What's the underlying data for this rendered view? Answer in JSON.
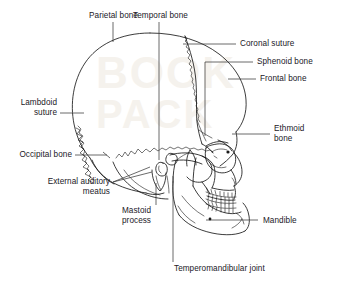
{
  "figure": {
    "type": "anatomical-line-diagram",
    "view": "lateral (left side), facing right",
    "background_color": "#ffffff",
    "line_color": "#1a1a1a",
    "watermark_color": "#f3efe9",
    "watermark_text": "BOOK PACK"
  },
  "labels": {
    "parietal_bone": "Parietal bone",
    "temporal_bone": "Temporal bone",
    "coronal_suture": "Coronal suture",
    "sphenoid_bone": "Sphenoid bone",
    "frontal_bone": "Frontal bone",
    "ethmoid_bone": "Ethmoid\nbone",
    "lambdoid_suture": "Lambdoid\nsuture",
    "occipital_bone": "Occipital bone",
    "external_auditory_meatus": "External auditory\nmeatus",
    "mastoid_process": "Mastoid\nprocess",
    "mandible": "Mandible",
    "temperomandibular_joint": "Temperomandibular joint"
  }
}
